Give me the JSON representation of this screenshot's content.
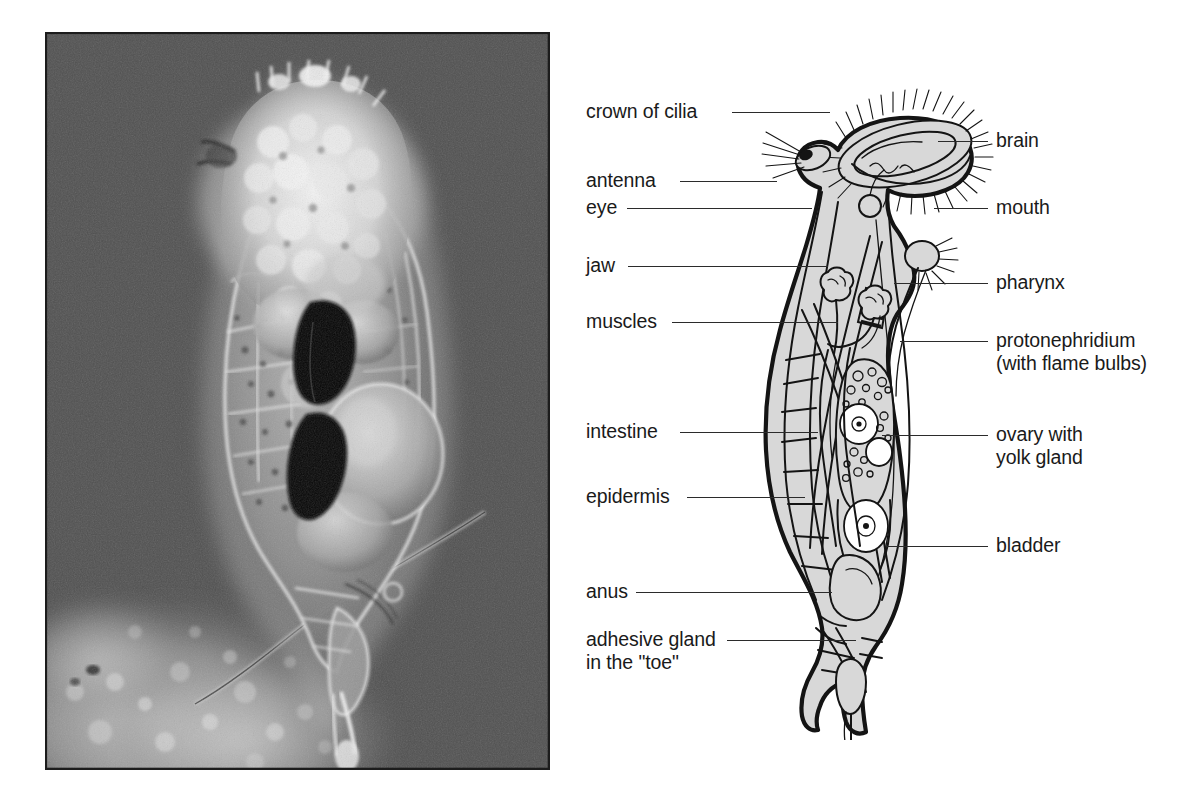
{
  "figure": {
    "kind": "biology-plate",
    "background_color": "#ffffff"
  },
  "photo": {
    "name": "rotifer-photomicrograph",
    "background_color": "#4a4a4a",
    "border_color": "#1c1c1c",
    "body_tint": "#cfcfcf",
    "highlight": "#f2f2f2",
    "dark_mass": "#0b0b0b",
    "debris_tint": "#b9b9b9",
    "caption": ""
  },
  "diagram": {
    "name": "rotifer-anatomy-diagram",
    "fill_color": "#d8d8d8",
    "line_color": "#1a1a1a",
    "leader_color": "#2b2b2b",
    "labels_left": [
      {
        "id": "crown-of-cilia",
        "text": "crown of cilia",
        "x": 586,
        "y": 100,
        "leader_x": 732,
        "leader_w": 98,
        "leader_y": 112
      },
      {
        "id": "antenna",
        "text": "antenna",
        "x": 586,
        "y": 169,
        "leader_x": 680,
        "leader_w": 97,
        "leader_y": 181
      },
      {
        "id": "eye",
        "text": "eye",
        "x": 586,
        "y": 196,
        "leader_x": 627,
        "leader_w": 185,
        "leader_y": 208
      },
      {
        "id": "jaw",
        "text": "jaw",
        "x": 586,
        "y": 254,
        "leader_x": 628,
        "leader_w": 200,
        "leader_y": 266
      },
      {
        "id": "muscles",
        "text": "muscles",
        "x": 586,
        "y": 310,
        "leader_x": 672,
        "leader_w": 166,
        "leader_y": 322
      },
      {
        "id": "intestine",
        "text": "intestine",
        "x": 586,
        "y": 420,
        "leader_x": 680,
        "leader_w": 138,
        "leader_y": 432
      },
      {
        "id": "epidermis",
        "text": "epidermis",
        "x": 586,
        "y": 485,
        "leader_x": 687,
        "leader_w": 118,
        "leader_y": 497
      },
      {
        "id": "anus",
        "text": "anus",
        "x": 586,
        "y": 580,
        "leader_x": 636,
        "leader_w": 196,
        "leader_y": 592
      },
      {
        "id": "adhesive-gland",
        "text": "adhesive gland",
        "x": 586,
        "y": 628,
        "leader_x": 727,
        "leader_w": 129,
        "leader_y": 640
      },
      {
        "id": "adhesive-gland-line2",
        "text": "in the \"toe\"",
        "x": 586,
        "y": 651,
        "leader_x": 0,
        "leader_w": 0,
        "leader_y": 0
      }
    ],
    "labels_right": [
      {
        "id": "brain",
        "text": "brain",
        "x": 996,
        "y": 129,
        "leader_x": 938,
        "leader_w": 50,
        "leader_y": 141
      },
      {
        "id": "mouth",
        "text": "mouth",
        "x": 996,
        "y": 196,
        "leader_x": 934,
        "leader_w": 54,
        "leader_y": 208
      },
      {
        "id": "pharynx",
        "text": "pharynx",
        "x": 996,
        "y": 271,
        "leader_x": 894,
        "leader_w": 94,
        "leader_y": 283
      },
      {
        "id": "protonephridium",
        "text": "protonephridium",
        "x": 996,
        "y": 329,
        "leader_x": 900,
        "leader_w": 88,
        "leader_y": 341
      },
      {
        "id": "protonephridium-line2",
        "text": "(with flame bulbs)",
        "x": 996,
        "y": 352,
        "leader_x": 0,
        "leader_w": 0,
        "leader_y": 0
      },
      {
        "id": "ovary-with",
        "text": "ovary with",
        "x": 996,
        "y": 423,
        "leader_x": 882,
        "leader_w": 106,
        "leader_y": 435
      },
      {
        "id": "ovary-with-line2",
        "text": "yolk gland",
        "x": 996,
        "y": 446,
        "leader_x": 0,
        "leader_w": 0,
        "leader_y": 0
      },
      {
        "id": "bladder",
        "text": "bladder",
        "x": 996,
        "y": 534,
        "leader_x": 886,
        "leader_w": 102,
        "leader_y": 546
      }
    ]
  }
}
